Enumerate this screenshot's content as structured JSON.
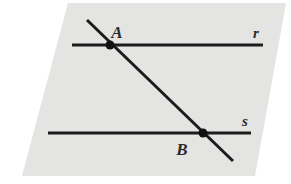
{
  "figure": {
    "type": "geometry-diagram",
    "plane": {
      "name": "plane-parallelogram",
      "fill_color": "#e4e4e2",
      "corners": [
        {
          "x": 68,
          "y": 3
        },
        {
          "x": 286,
          "y": 3
        },
        {
          "x": 255,
          "y": 176
        },
        {
          "x": 22,
          "y": 176
        }
      ]
    },
    "lines": [
      {
        "id": "line-r",
        "label": "r",
        "label_x": 256,
        "label_y": 38,
        "x1": 72,
        "y1": 45,
        "x2": 263,
        "y2": 45,
        "color": "#1c1c1c",
        "width": 3
      },
      {
        "id": "line-s",
        "label": "s",
        "label_x": 245,
        "label_y": 126,
        "x1": 48,
        "y1": 133,
        "x2": 251,
        "y2": 133,
        "color": "#1c1c1c",
        "width": 3
      },
      {
        "id": "line-transversal",
        "label": "",
        "label_x": 0,
        "label_y": 0,
        "x1": 87,
        "y1": 20,
        "x2": 233,
        "y2": 161,
        "color": "#1c1c1c",
        "width": 3
      }
    ],
    "points": [
      {
        "id": "point-a",
        "label": "A",
        "x": 110,
        "y": 45,
        "label_x": 117,
        "label_y": 38,
        "radius": 4.5,
        "color": "#111111"
      },
      {
        "id": "point-b",
        "label": "B",
        "x": 203,
        "y": 133,
        "label_x": 182,
        "label_y": 155,
        "radius": 4.5,
        "color": "#111111"
      }
    ]
  }
}
